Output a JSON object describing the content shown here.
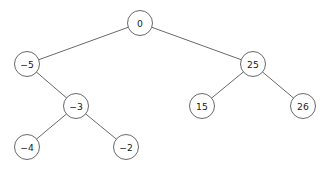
{
  "figure": {
    "background_color": "#ffffff",
    "stroke_color": "#58585a",
    "node_fill_color": "#ffffff",
    "label_color": "#1a1a1a",
    "node_radius": 12.5,
    "width": 329,
    "height": 171
  },
  "chart_data": {
    "type": "diagram",
    "diagram_kind": "binary-search-tree",
    "title": "",
    "nodes": [
      {
        "id": "n0",
        "label": "0",
        "value": 0,
        "x": 140,
        "y": 23,
        "depth": 0,
        "role": "root"
      },
      {
        "id": "nm5",
        "label": "−5",
        "value": -5,
        "x": 27,
        "y": 64,
        "depth": 1,
        "role": "left-child"
      },
      {
        "id": "n25",
        "label": "25",
        "value": 25,
        "x": 253,
        "y": 64,
        "depth": 1,
        "role": "right-child"
      },
      {
        "id": "nm3",
        "label": "−3",
        "value": -3,
        "x": 76,
        "y": 106,
        "depth": 2,
        "role": "right-child"
      },
      {
        "id": "n15",
        "label": "15",
        "value": 15,
        "x": 202,
        "y": 106,
        "depth": 2,
        "role": "left-child"
      },
      {
        "id": "n26",
        "label": "26",
        "value": 26,
        "x": 303,
        "y": 106,
        "depth": 2,
        "role": "right-child"
      },
      {
        "id": "nm4",
        "label": "−4",
        "value": -4,
        "x": 27,
        "y": 147,
        "depth": 3,
        "role": "left-child"
      },
      {
        "id": "nm2",
        "label": "−2",
        "value": -2,
        "x": 126,
        "y": 147,
        "depth": 3,
        "role": "right-child"
      }
    ],
    "edges": [
      {
        "from": "n0",
        "to": "nm5",
        "side": "left"
      },
      {
        "from": "n0",
        "to": "n25",
        "side": "right"
      },
      {
        "from": "nm5",
        "to": "nm3",
        "side": "right"
      },
      {
        "from": "n25",
        "to": "n15",
        "side": "left"
      },
      {
        "from": "n25",
        "to": "n26",
        "side": "right"
      },
      {
        "from": "nm3",
        "to": "nm4",
        "side": "left"
      },
      {
        "from": "nm3",
        "to": "nm2",
        "side": "right"
      }
    ]
  }
}
